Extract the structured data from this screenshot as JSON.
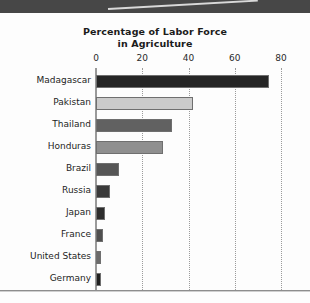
{
  "chart_data": {
    "type": "bar",
    "orientation": "horizontal",
    "title": "Percentage of Labor Force in Agriculture",
    "title_line1": "Percentage of Labor Force",
    "title_line2": "in Agriculture",
    "xlabel": "",
    "ylabel": "",
    "xlim": [
      0,
      80
    ],
    "xticks": [
      0,
      20,
      40,
      60,
      80
    ],
    "xtick_labels": [
      "0",
      "20",
      "40",
      "60",
      "80"
    ],
    "grid": "vertical-dotted",
    "legend": "none",
    "categories": [
      "Madagascar",
      "Pakistan",
      "Thailand",
      "Honduras",
      "Brazil",
      "Russia",
      "Japan",
      "France",
      "United States",
      "Germany"
    ],
    "values": [
      75,
      42,
      33,
      29,
      10,
      6,
      4,
      3,
      2,
      2
    ],
    "bar_colors": [
      "#262626",
      "#cbcbcb",
      "#616161",
      "#8f8f8f",
      "#565656",
      "#3a3a3a",
      "#2d2d2d",
      "#4f4f4f",
      "#6b6b6b",
      "#1f1f1f"
    ],
    "bars": [
      {
        "label": "Madagascar",
        "value": 75,
        "color": "#262626"
      },
      {
        "label": "Pakistan",
        "value": 42,
        "color": "#cbcbcb"
      },
      {
        "label": "Thailand",
        "value": 33,
        "color": "#616161"
      },
      {
        "label": "Honduras",
        "value": 29,
        "color": "#8f8f8f"
      },
      {
        "label": "Brazil",
        "value": 10,
        "color": "#565656"
      },
      {
        "label": "Russia",
        "value": 6,
        "color": "#3a3a3a"
      },
      {
        "label": "Japan",
        "value": 4,
        "color": "#2d2d2d"
      },
      {
        "label": "France",
        "value": 3,
        "color": "#4f4f4f"
      },
      {
        "label": "United States",
        "value": 2,
        "color": "#6b6b6b"
      },
      {
        "label": "Germany",
        "value": 2,
        "color": "#1f1f1f"
      }
    ]
  },
  "page": {
    "background_color": "#fdfdfd",
    "top_band_color": "#474747",
    "rule_color": "#8d8d8d",
    "axis_color": "#9a9a9a",
    "grid_color": "#9b9b9b",
    "text_color": "#1d1d1d"
  }
}
